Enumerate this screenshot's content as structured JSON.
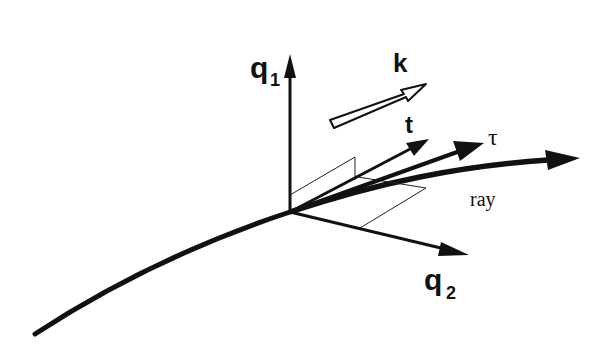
{
  "diagram": {
    "type": "vector-geometry",
    "labels": {
      "q1_main": "q",
      "q1_sub": "1",
      "q2_main": "q",
      "q2_sub": "2",
      "k": "k",
      "t": "t",
      "tau": "τ",
      "ray": "ray"
    },
    "colors": {
      "ink": "#111111",
      "background": "#ffffff"
    },
    "elements": [
      {
        "name": "q1-axis",
        "from": [
          290,
          212
        ],
        "to": [
          290,
          55
        ]
      },
      {
        "name": "q2-axis",
        "from": [
          290,
          212
        ],
        "to": [
          468,
          255
        ]
      },
      {
        "name": "k-vector",
        "style": "hollow-arrow",
        "from": [
          330,
          120
        ],
        "to": [
          426,
          85
        ]
      },
      {
        "name": "t-vector",
        "from": [
          290,
          212
        ],
        "to": [
          428,
          140
        ]
      },
      {
        "name": "tau-vector",
        "from": [
          290,
          212
        ],
        "to": [
          483,
          143
        ]
      },
      {
        "name": "ray-curve",
        "style": "thick-curved-arrow",
        "from": [
          35,
          335
        ],
        "through": [
          290,
          212
        ],
        "to": [
          580,
          158
        ]
      }
    ]
  }
}
